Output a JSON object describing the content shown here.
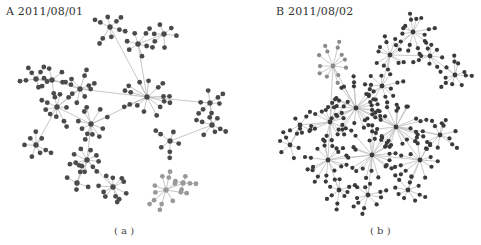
{
  "panels": [
    {
      "id": "a",
      "title": "A 2011/08/01",
      "caption": "( a )",
      "colors": {
        "node": "#4a4a4a",
        "node_light": "#999999",
        "edge": "#b8b8b8"
      },
      "hubs": [
        {
          "x": 147,
          "y": 97,
          "n": 12,
          "r": 22,
          "light": false
        },
        {
          "x": 110,
          "y": 27,
          "n": 6,
          "r": 14,
          "light": false
        },
        {
          "x": 138,
          "y": 44,
          "n": 6,
          "r": 15,
          "light": false
        },
        {
          "x": 164,
          "y": 34,
          "n": 6,
          "r": 14,
          "light": false
        },
        {
          "x": 80,
          "y": 89,
          "n": 8,
          "r": 15,
          "light": false
        },
        {
          "x": 57,
          "y": 107,
          "n": 9,
          "r": 17,
          "light": false
        },
        {
          "x": 91,
          "y": 124,
          "n": 10,
          "r": 18,
          "light": false
        },
        {
          "x": 52,
          "y": 80,
          "n": 6,
          "r": 14,
          "light": false
        },
        {
          "x": 36,
          "y": 79,
          "n": 5,
          "r": 12,
          "light": false
        },
        {
          "x": 36,
          "y": 145,
          "n": 7,
          "r": 14,
          "light": false
        },
        {
          "x": 87,
          "y": 160,
          "n": 9,
          "r": 16,
          "light": false
        },
        {
          "x": 113,
          "y": 187,
          "n": 10,
          "r": 15,
          "light": false
        },
        {
          "x": 210,
          "y": 103,
          "n": 6,
          "r": 13,
          "light": false
        },
        {
          "x": 212,
          "y": 125,
          "n": 6,
          "r": 13,
          "light": false
        },
        {
          "x": 170,
          "y": 141,
          "n": 5,
          "r": 14,
          "light": false
        },
        {
          "x": 77,
          "y": 183,
          "n": 4,
          "r": 12,
          "light": false
        },
        {
          "x": 166,
          "y": 190,
          "n": 9,
          "r": 18,
          "light": true
        },
        {
          "x": 183,
          "y": 183,
          "n": 4,
          "r": 10,
          "light": true
        }
      ],
      "links": [
        [
          0,
          1
        ],
        [
          0,
          2
        ],
        [
          2,
          3
        ],
        [
          0,
          4
        ],
        [
          4,
          5
        ],
        [
          5,
          6
        ],
        [
          4,
          7
        ],
        [
          7,
          8
        ],
        [
          5,
          9
        ],
        [
          6,
          10
        ],
        [
          10,
          11
        ],
        [
          0,
          12
        ],
        [
          12,
          13
        ],
        [
          13,
          14
        ],
        [
          6,
          0
        ],
        [
          10,
          15
        ],
        [
          16,
          17
        ]
      ]
    },
    {
      "id": "b",
      "title": "B 2011/08/02",
      "caption": "( b )",
      "colors": {
        "node": "#3a3a3a",
        "node_light": "#8a8a8a",
        "edge": "#bdbdbd"
      },
      "hubs": [
        {
          "x": 413,
          "y": 32,
          "n": 12,
          "r": 18,
          "light": false
        },
        {
          "x": 390,
          "y": 55,
          "n": 10,
          "r": 17,
          "light": false
        },
        {
          "x": 430,
          "y": 56,
          "n": 8,
          "r": 14,
          "light": false
        },
        {
          "x": 455,
          "y": 75,
          "n": 9,
          "r": 14,
          "light": false
        },
        {
          "x": 333,
          "y": 66,
          "n": 11,
          "r": 19,
          "light": true
        },
        {
          "x": 356,
          "y": 108,
          "n": 22,
          "r": 26,
          "light": false
        },
        {
          "x": 396,
          "y": 127,
          "n": 22,
          "r": 26,
          "light": false
        },
        {
          "x": 372,
          "y": 155,
          "n": 20,
          "r": 26,
          "light": false
        },
        {
          "x": 330,
          "y": 122,
          "n": 14,
          "r": 22,
          "light": false
        },
        {
          "x": 328,
          "y": 160,
          "n": 14,
          "r": 20,
          "light": false
        },
        {
          "x": 420,
          "y": 160,
          "n": 12,
          "r": 20,
          "light": false
        },
        {
          "x": 440,
          "y": 135,
          "n": 10,
          "r": 18,
          "light": false
        },
        {
          "x": 368,
          "y": 195,
          "n": 9,
          "r": 14,
          "light": false
        },
        {
          "x": 339,
          "y": 190,
          "n": 8,
          "r": 14,
          "light": false
        },
        {
          "x": 300,
          "y": 125,
          "n": 5,
          "r": 12,
          "light": false
        },
        {
          "x": 408,
          "y": 190,
          "n": 8,
          "r": 14,
          "light": false
        },
        {
          "x": 382,
          "y": 86,
          "n": 10,
          "r": 16,
          "light": false
        },
        {
          "x": 290,
          "y": 145,
          "n": 6,
          "r": 14,
          "light": false
        }
      ],
      "links": [
        [
          0,
          1
        ],
        [
          1,
          2
        ],
        [
          2,
          3
        ],
        [
          1,
          16
        ],
        [
          16,
          5
        ],
        [
          4,
          5
        ],
        [
          5,
          6
        ],
        [
          6,
          7
        ],
        [
          5,
          8
        ],
        [
          8,
          9
        ],
        [
          7,
          9
        ],
        [
          6,
          10
        ],
        [
          6,
          11
        ],
        [
          7,
          12
        ],
        [
          9,
          13
        ],
        [
          8,
          14
        ],
        [
          10,
          15
        ],
        [
          14,
          17
        ],
        [
          7,
          10
        ],
        [
          4,
          8
        ]
      ]
    }
  ]
}
